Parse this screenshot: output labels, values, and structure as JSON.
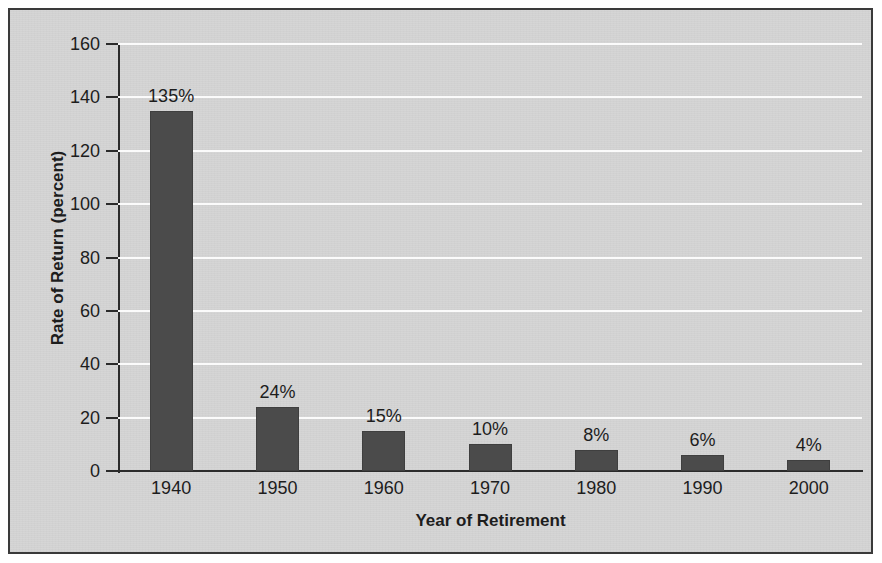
{
  "chart_data": {
    "type": "bar",
    "title": "",
    "xlabel": "Year of Retirement",
    "ylabel": "Rate of Return (percent)",
    "categories": [
      "1940",
      "1950",
      "1960",
      "1970",
      "1980",
      "1990",
      "2000"
    ],
    "values": [
      135,
      24,
      15,
      10,
      8,
      6,
      4
    ],
    "data_labels": [
      "135%",
      "24%",
      "15%",
      "10%",
      "8%",
      "6%",
      "4%"
    ],
    "ylim": [
      0,
      160
    ],
    "yticks": [
      0,
      20,
      40,
      60,
      80,
      100,
      120,
      140,
      160
    ],
    "ytick_labels": [
      "0",
      "20",
      "40",
      "60",
      "80",
      "100",
      "120",
      "140",
      "160"
    ],
    "grid": true,
    "grid_axis": "y",
    "grid_color": "#fbfbfb",
    "legend": false,
    "bar_color": "#4b4b4b",
    "plot_background": "#d5d5d5",
    "axis_color": "#2b2b2b",
    "frame_color": "#3a3a3a"
  }
}
